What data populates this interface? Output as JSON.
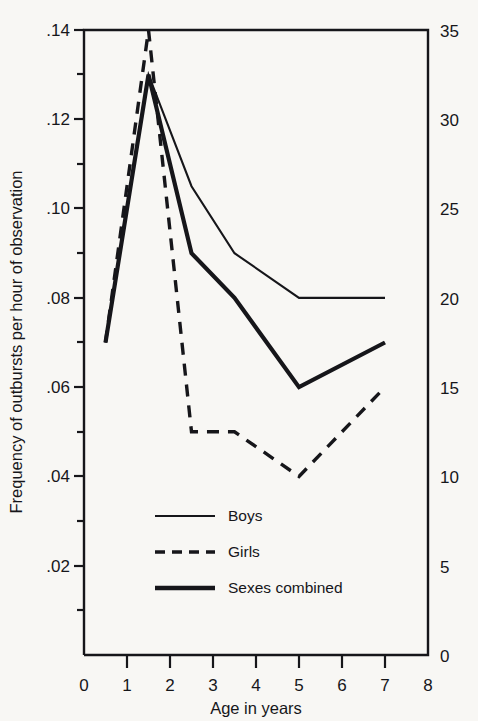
{
  "chart_data": {
    "type": "line",
    "title": "",
    "xlabel": "Age in years",
    "ylabel": "Frequency of outbursts per hour of observation",
    "ylabel_right": "",
    "xlim": [
      0,
      8
    ],
    "ylim": [
      0,
      0.14
    ],
    "ylim_right": [
      0,
      35
    ],
    "grid": false,
    "legend_position": "lower-center-inside",
    "xticks": [
      "0",
      "1",
      "2",
      "3",
      "4",
      "5",
      "6",
      "7",
      "8"
    ],
    "xtick_values": [
      0,
      1,
      2,
      3,
      4,
      5,
      6,
      7,
      8
    ],
    "yticks": [
      ".02",
      ".04",
      ".06",
      ".08",
      ".10",
      ".12",
      ".14"
    ],
    "ytick_values": [
      0.02,
      0.04,
      0.06,
      0.08,
      0.1,
      0.12,
      0.14
    ],
    "yticks_right": [
      "0",
      "5",
      "10",
      "15",
      "20",
      "25",
      "30",
      "35"
    ],
    "ytick_right_values": [
      0,
      5,
      10,
      15,
      20,
      25,
      30,
      35
    ],
    "y_minor_ticks": [
      0.01,
      0.03,
      0.05,
      0.07,
      0.09,
      0.11,
      0.13
    ],
    "series": [
      {
        "name": "Boys",
        "style": "solid-thin",
        "x": [
          0.5,
          1.5,
          2.5,
          3.5,
          5.0,
          7.0
        ],
        "y": [
          0.07,
          0.13,
          0.105,
          0.09,
          0.08,
          0.08
        ]
      },
      {
        "name": "Girls",
        "style": "dashed",
        "x": [
          0.5,
          1.5,
          2.5,
          3.5,
          5.0,
          7.0
        ],
        "y": [
          0.07,
          0.14,
          0.05,
          0.05,
          0.04,
          0.06
        ]
      },
      {
        "name": "Sexes combined",
        "style": "solid-thick",
        "x": [
          0.5,
          1.5,
          2.5,
          3.5,
          5.0,
          7.0
        ],
        "y": [
          0.07,
          0.13,
          0.09,
          0.08,
          0.06,
          0.07
        ]
      }
    ]
  },
  "legend": {
    "entries": [
      {
        "label": "Boys",
        "style": "solid-thin"
      },
      {
        "label": "Girls",
        "style": "dashed"
      },
      {
        "label": "Sexes combined",
        "style": "solid-thick"
      }
    ]
  },
  "axes": {
    "x_title": "Age in years",
    "y_title": "Frequency of outbursts per hour of observation"
  },
  "colors": {
    "ink": "#16161a",
    "paper": "#f8f7f4"
  }
}
